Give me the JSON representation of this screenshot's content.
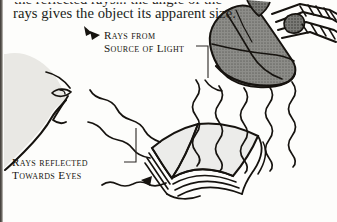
{
  "page": {
    "background": "#fdfdfb",
    "ink_color": "#16130f",
    "width": 337,
    "height": 222
  },
  "body_text": {
    "clipped_line": "the reflected rays... the angle of the",
    "visible_line": "rays gives the object its apparent size."
  },
  "callouts": [
    {
      "name": "rays-from-source-of-light",
      "lines": [
        "Rays from",
        "Source of Light"
      ],
      "has_bracket": true,
      "has_arrow": true
    },
    {
      "name": "rays-reflected-towards-eyes",
      "lines": [
        "Rays reflected",
        "Towards Eyes"
      ],
      "has_bracket": true,
      "has_arrow": true
    }
  ],
  "figure": {
    "elements": [
      {
        "name": "desk-lamp",
        "fill": "#8a8a86",
        "description": "shaded lamp head with articulated spring arm"
      },
      {
        "name": "open-book",
        "fill": "#ececea",
        "description": "open book lying on a surface"
      },
      {
        "name": "face-profile",
        "fill": "#e9e8e4",
        "description": "partial profile of a face with eye at left"
      },
      {
        "name": "incident-rays",
        "count": 5,
        "description": "wavy rays travelling down from lamp to book"
      },
      {
        "name": "reflected-rays",
        "count": 3,
        "description": "wavy rays travelling up-left from book to eye"
      }
    ],
    "colors": {
      "lamp_shade": "#8a8a86",
      "lamp_shade_dark": "#6e6e6a",
      "book_page": "#ececea",
      "face": "#e9e8e4",
      "ink": "#16130f"
    }
  }
}
